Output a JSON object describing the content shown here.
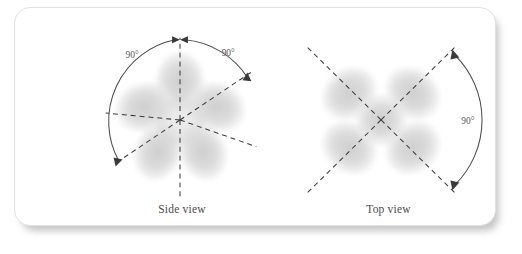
{
  "figure": {
    "background_color": "#ffffff",
    "card": {
      "fill": "#ffffff",
      "border_color": "#e2e2e2",
      "shadow_color": "#9a9a9a"
    },
    "lobe_color": "#dcdcdc",
    "lobe_core_color": "#cfcfcf",
    "axis_color": "#3a3a3a",
    "arc_color": "#4a4a4a",
    "label_color": "#555555"
  },
  "panels": [
    {
      "id": "side-view",
      "caption": "Side view",
      "geometry": "trigonal-bipyramidal-hybrid-orbitals",
      "lobe_count": 5,
      "angle_labels": [
        {
          "id": "side-angle-left",
          "text": "90°"
        },
        {
          "id": "side-angle-right",
          "text": "90°"
        }
      ]
    },
    {
      "id": "top-view",
      "caption": "Top view",
      "geometry": "square-planar-hybrid-orbitals",
      "lobe_count": 5,
      "angle_labels": [
        {
          "id": "top-angle-right",
          "text": "90°"
        }
      ]
    }
  ]
}
